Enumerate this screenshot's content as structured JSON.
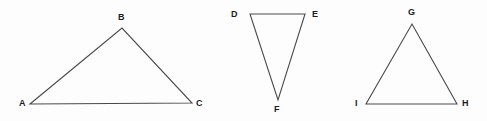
{
  "figure": {
    "background_color": "#fdfdfd",
    "stroke_color": "#4a4a4a",
    "label_color": "#1c1c1c",
    "width": 487,
    "height": 121
  },
  "triangles": [
    {
      "id": "ABC",
      "name": "triangle-abc",
      "points": "30,104 122,28 192,103",
      "vertices": [
        {
          "label": "A",
          "name": "vertex-label-a",
          "x": 19,
          "y": 99
        },
        {
          "label": "B",
          "name": "vertex-label-b",
          "x": 118,
          "y": 13
        },
        {
          "label": "C",
          "name": "vertex-label-c",
          "x": 196,
          "y": 99
        }
      ]
    },
    {
      "id": "DEF",
      "name": "triangle-def",
      "points": "250,14 305,14 278,100",
      "vertices": [
        {
          "label": "D",
          "name": "vertex-label-d",
          "x": 231,
          "y": 10
        },
        {
          "label": "E",
          "name": "vertex-label-e",
          "x": 312,
          "y": 10
        },
        {
          "label": "F",
          "name": "vertex-label-f",
          "x": 274,
          "y": 105
        }
      ]
    },
    {
      "id": "GHI",
      "name": "triangle-ghi",
      "points": "412,24 457,104 366,104",
      "vertices": [
        {
          "label": "G",
          "name": "vertex-label-g",
          "x": 408,
          "y": 8
        },
        {
          "label": "H",
          "name": "vertex-label-h",
          "x": 462,
          "y": 99
        },
        {
          "label": "I",
          "name": "vertex-label-i",
          "x": 355,
          "y": 99
        }
      ]
    }
  ]
}
